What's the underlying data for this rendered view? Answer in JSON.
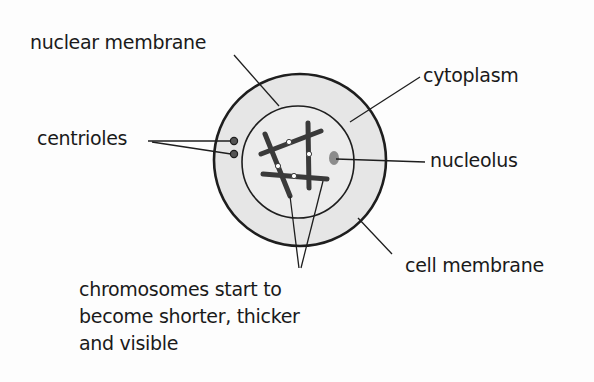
{
  "diagram": {
    "labels": {
      "nuclear_membrane": "nuclear membrane",
      "cytoplasm": "cytoplasm",
      "centrioles": "centrioles",
      "nucleolus": "nucleolus",
      "cell_membrane": "cell membrane",
      "chromosomes": "chromosomes start to\nbecome shorter, thicker\nand visible"
    },
    "colors": {
      "cytoplasm_fill": "#e6e6e6",
      "nucleus_fill": "#ececec",
      "outline": "#1e1e1e",
      "chromosome": "#3a3a3a",
      "nucleolus": "#8c8c8c",
      "text": "#1a1a1a"
    },
    "structures": {
      "cell": {
        "cx": 300,
        "cy": 160,
        "r": 86
      },
      "nucleus": {
        "cx": 298,
        "cy": 162,
        "r": 56
      },
      "centrioles": [
        {
          "cx": 234,
          "cy": 141
        },
        {
          "cx": 234,
          "cy": 154
        }
      ],
      "nucleolus": {
        "cx": 334,
        "cy": 158,
        "rx": 5,
        "ry": 7
      },
      "chromosome_count": 4
    }
  }
}
